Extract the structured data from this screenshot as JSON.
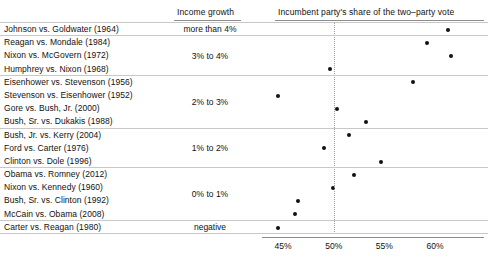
{
  "header": {
    "income_growth": "Income growth",
    "vote_share": "Incumbent party's share of the two–party vote"
  },
  "chart_data": {
    "type": "scatter",
    "title": "",
    "xlabel": "Incumbent party's share of the two–party vote",
    "ylabel": "Income growth",
    "xlim": [
      43.5,
      62.0
    ],
    "xticks": [
      "45%",
      "50%",
      "55%",
      "60%"
    ],
    "xtick_values": [
      45,
      50,
      55,
      60
    ],
    "grid": false,
    "reference_line": 50,
    "legend": "none",
    "groups": [
      {
        "label": "more than 4%",
        "points": [
          {
            "label": "Johnson vs. Goldwater (1964)",
            "value": 61.3
          }
        ]
      },
      {
        "label": "3% to 4%",
        "points": [
          {
            "label": "Reagan vs. Mondale (1984)",
            "value": 59.2
          },
          {
            "label": "Nixon vs. McGovern (1972)",
            "value": 61.6
          },
          {
            "label": "Humphrey vs. Nixon (1968)",
            "value": 49.6
          }
        ]
      },
      {
        "label": "2% to 3%",
        "points": [
          {
            "label": "Eisenhower vs. Stevenson (1956)",
            "value": 57.8
          },
          {
            "label": "Stevenson vs. Eisenhower (1952)",
            "value": 44.5
          },
          {
            "label": "Gore vs. Bush, Jr. (2000)",
            "value": 50.3
          },
          {
            "label": "Bush, Sr. vs. Dukakis (1988)",
            "value": 53.2
          }
        ]
      },
      {
        "label": "1% to 2%",
        "points": [
          {
            "label": "Bush, Jr. vs. Kerry (2004)",
            "value": 51.5
          },
          {
            "label": "Ford vs. Carter (1976)",
            "value": 49.0
          },
          {
            "label": "Clinton vs. Dole (1996)",
            "value": 54.7
          }
        ]
      },
      {
        "label": "0% to 1%",
        "points": [
          {
            "label": "Obama vs. Romney (2012)",
            "value": 52.0
          },
          {
            "label": "Nixon vs. Kennedy (1960)",
            "value": 49.9
          },
          {
            "label": "Bush, Sr. vs. Clinton (1992)",
            "value": 46.5
          },
          {
            "label": "McCain vs. Obama (2008)",
            "value": 46.2
          }
        ]
      },
      {
        "label": "negative",
        "points": [
          {
            "label": "Carter vs. Reagan (1980)",
            "value": 44.5
          }
        ]
      }
    ]
  }
}
